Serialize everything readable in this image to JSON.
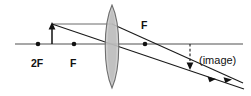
{
  "figure": {
    "name": "converging-lens-ray-diagram",
    "width": 251,
    "height": 96,
    "background_color": "#ffffff"
  },
  "labels": {
    "two_f_left": "2F",
    "f_left": "F",
    "f_right": "F",
    "image": "(image)"
  },
  "optics": {
    "lens_type": "biconvex converging lens",
    "principal_axis": {
      "y": 44,
      "x_start": 15,
      "x_end": 243,
      "color": "#8a8a8a"
    },
    "lens": {
      "center_x": 112,
      "top_y": 5,
      "bottom_y": 88,
      "half_width": 8,
      "fill_color": "#c8c8c8",
      "stroke_color": "#6e6e6e"
    },
    "points": [
      {
        "name": "2F-left",
        "x": 38,
        "y": 44,
        "label": "2F"
      },
      {
        "name": "F-left",
        "x": 74,
        "y": 44,
        "label": "F"
      },
      {
        "name": "F-right",
        "x": 145,
        "y": 44,
        "label": "F"
      }
    ],
    "object": {
      "name": "object-arrow",
      "base_x": 52,
      "base_y": 44,
      "tip_x": 52,
      "tip_y": 24,
      "direction": "up"
    },
    "image": {
      "name": "image-arrow",
      "base_x": 190,
      "base_y": 44,
      "tip_x": 190,
      "tip_y": 68,
      "direction": "down",
      "style": "dashed",
      "label": "(image)"
    },
    "rays": [
      {
        "name": "parallel-ray-incident",
        "from_x": 52,
        "from_y": 24,
        "to_x": 112,
        "to_y": 24,
        "description": "parallel to axis from object tip to lens"
      },
      {
        "name": "parallel-ray-refracted",
        "from_x": 112,
        "from_y": 24,
        "to_x": 243,
        "to_y": 80,
        "description": "refracted through far focal point F and beyond image"
      },
      {
        "name": "center-ray",
        "from_x": 52,
        "from_y": 24,
        "to_x": 243,
        "to_y": 88,
        "description": "straight ray through optical centre of lens, continues past image"
      }
    ],
    "colors": {
      "ray": "#1a1a1a",
      "axis": "#8a8a8a",
      "lens_fill": "#c8c8c8",
      "dot": "#111111",
      "text": "#111111"
    }
  }
}
